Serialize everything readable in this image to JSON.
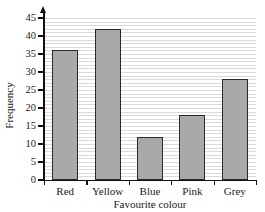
{
  "figure": {
    "item_marker": ")",
    "background_color": "#ffffff"
  },
  "chart_data": {
    "type": "bar",
    "title": "",
    "categories": [
      "Red",
      "Yellow",
      "Blue",
      "Pink",
      "Grey"
    ],
    "values": [
      36,
      42,
      12,
      18,
      28
    ],
    "xlabel": "Favourite colour",
    "ylabel": "Frequency",
    "ylim": [
      0,
      45
    ],
    "ytick_values": [
      0,
      5,
      10,
      15,
      20,
      25,
      30,
      35,
      40,
      45
    ],
    "ytick_labels": [
      "0",
      "5",
      "10",
      "15",
      "20",
      "25",
      "30",
      "35",
      "40",
      "45"
    ],
    "ytick_step": 5,
    "grid": true,
    "grid_orientation": "horizontal",
    "grid_minor_step": 1,
    "grid_color": "#d9d9d9",
    "legend": null,
    "bar_fill_color": "#a9a9a9",
    "bar_edge_color": "#2a2a2a",
    "axis_color": "#111111",
    "y_axis_arrow": true
  }
}
